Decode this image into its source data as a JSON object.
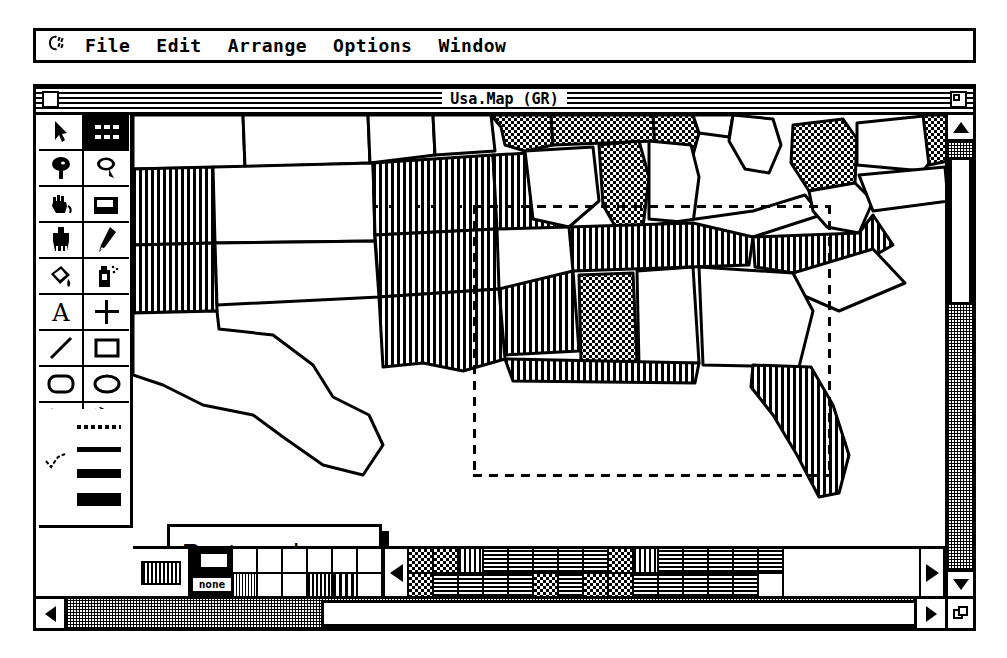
{
  "menubar": {
    "apple_icon": "apple-icon",
    "items": [
      {
        "label": "File"
      },
      {
        "label": "Edit"
      },
      {
        "label": "Arrange"
      },
      {
        "label": "Options"
      },
      {
        "label": "Window"
      }
    ]
  },
  "window": {
    "title": "Usa.Map (GR)",
    "close_box": "close-box",
    "zoom_box": "zoom-box"
  },
  "toolbox": {
    "tools": [
      {
        "name": "arrow-pointer",
        "selected": false
      },
      {
        "name": "rectangular-marquee",
        "selected": true
      },
      {
        "name": "lasso-filled",
        "selected": false
      },
      {
        "name": "lasso-outline",
        "selected": false
      },
      {
        "name": "grabber-hand",
        "selected": false
      },
      {
        "name": "camera",
        "selected": false
      },
      {
        "name": "paintbrush",
        "selected": false
      },
      {
        "name": "pencil",
        "selected": false
      },
      {
        "name": "paint-bucket",
        "selected": false
      },
      {
        "name": "spray-can",
        "selected": false
      },
      {
        "name": "text-tool",
        "selected": false
      },
      {
        "name": "crosshair-tool",
        "selected": false
      },
      {
        "name": "line-tool",
        "selected": false
      },
      {
        "name": "rectangle-tool",
        "selected": false
      },
      {
        "name": "rounded-rectangle-tool",
        "selected": false
      },
      {
        "name": "oval-tool",
        "selected": false
      },
      {
        "name": "arc-tool",
        "selected": false
      },
      {
        "name": "polygon-tool",
        "selected": false
      }
    ],
    "line_widths": [
      {
        "name": "dotted-line",
        "selected": true
      },
      {
        "name": "thin-line",
        "selected": false
      },
      {
        "name": "medium-line",
        "selected": false
      },
      {
        "name": "thick-line",
        "selected": false
      }
    ]
  },
  "callout": {
    "line1": "Rectangular",
    "line2": "marquee"
  },
  "patterns": {
    "current_pattern": "vertical-stripes",
    "none_label": "none",
    "scroll_left": "pattern-scroll-left",
    "scroll_right": "pattern-scroll-right",
    "swatches": [
      "white",
      "vertical-fine",
      "white",
      "white",
      "white",
      "white",
      "white",
      "vertical-medium",
      "white",
      "vertical-coarse",
      "white",
      "checker-dense",
      "checker-dense",
      "checker-dense",
      "dot-grid",
      "vertical-lines",
      "dot-grid",
      "dot-grid",
      "dot-grid",
      "dot-grid",
      "dot-grid",
      "dot-grid",
      "checker-dense",
      "dot-grid",
      "dot-grid",
      "dot-grid",
      "checker-dense",
      "checker-dense",
      "checker-dense",
      "vertical-lines",
      "dot-grid",
      "dot-grid",
      "dot-grid",
      "dot-grid",
      "dot-grid",
      "dot-grid",
      "dot-grid",
      "dot-grid",
      "dot-grid",
      "dot-grid"
    ]
  },
  "scrollbars": {
    "vertical": {
      "up": "scroll-up-arrow",
      "down": "scroll-down-arrow"
    },
    "horizontal": {
      "left": "scroll-left-arrow",
      "right": "scroll-right-arrow"
    },
    "grow_box": "grow-box"
  },
  "canvas": {
    "document_name": "Usa.Map",
    "selection": {
      "tool": "rectangular-marquee",
      "shape": "dashed-rectangle"
    }
  },
  "colors": {
    "ink": "#000000",
    "paper": "#ffffff"
  }
}
